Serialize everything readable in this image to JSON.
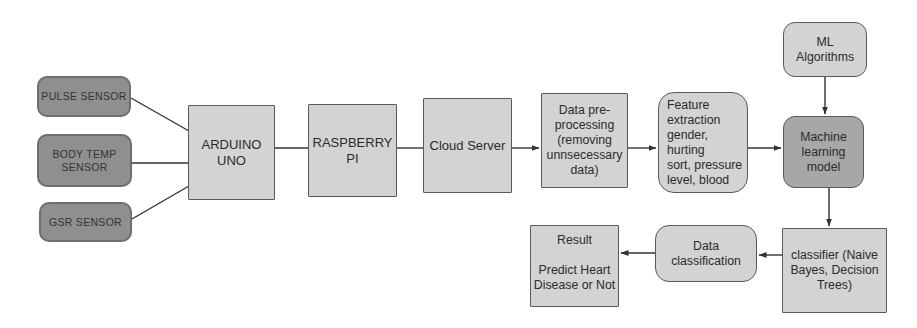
{
  "diagram": {
    "nodes": {
      "pulse_sensor": {
        "label": "PULSE SENSOR"
      },
      "body_temp_sensor": {
        "label": "BODY TEMP\nSENSOR"
      },
      "gsr_sensor": {
        "label": "GSR SENSOR"
      },
      "arduino": {
        "label": "ARDUINO UNO"
      },
      "raspberry": {
        "label": "RASPBERRY PI"
      },
      "cloud": {
        "label": "Cloud Server"
      },
      "preprocessing": {
        "label": "Data pre-\nprocessing\n(removing\nunnsecessary\ndata)"
      },
      "feature_extraction": {
        "label": "Feature\nextraction\ngender, hurting\nsort, pressure\nlevel, blood"
      },
      "ml_algorithms": {
        "label": "ML\nAlgorithms"
      },
      "ml_model": {
        "label": "Machine\nlearning\nmodel"
      },
      "classifier": {
        "label": "classifier (Naive\nBayes, Decision\nTrees)"
      },
      "data_classification": {
        "label": "Data\nclassification"
      },
      "result": {
        "label": "Result\n\nPredict Heart\nDisease or Not"
      }
    },
    "edges": [
      {
        "from": "pulse_sensor",
        "to": "arduino",
        "arrow": false
      },
      {
        "from": "body_temp_sensor",
        "to": "arduino",
        "arrow": false
      },
      {
        "from": "gsr_sensor",
        "to": "arduino",
        "arrow": false
      },
      {
        "from": "arduino",
        "to": "raspberry",
        "arrow": false
      },
      {
        "from": "raspberry",
        "to": "cloud",
        "arrow": false
      },
      {
        "from": "cloud",
        "to": "preprocessing",
        "arrow": true
      },
      {
        "from": "preprocessing",
        "to": "feature_extraction",
        "arrow": true
      },
      {
        "from": "feature_extraction",
        "to": "ml_model",
        "arrow": true
      },
      {
        "from": "ml_algorithms",
        "to": "ml_model",
        "arrow": true
      },
      {
        "from": "ml_model",
        "to": "classifier",
        "arrow": true
      },
      {
        "from": "classifier",
        "to": "data_classification",
        "arrow": true
      },
      {
        "from": "data_classification",
        "to": "result",
        "arrow": true
      }
    ],
    "colors": {
      "background": "#ffffff",
      "sensor_fill": "#8f8f8f",
      "sensor_border": "#6e6e6e",
      "light_fill": "#d3d3d3",
      "mid_fill": "#a7a7a7",
      "box_border": "#5a5a5a",
      "line": "#333333",
      "text": "#2b2b2b"
    }
  }
}
